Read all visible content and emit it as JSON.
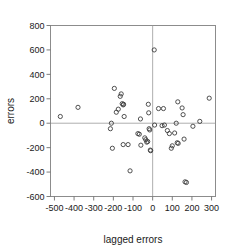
{
  "chart_data": {
    "type": "scatter",
    "title": "",
    "xlabel": "lagged errors",
    "ylabel": "errors",
    "xlim": [
      -520,
      320
    ],
    "ylim": [
      -600,
      800
    ],
    "xticks": [
      -500,
      -400,
      -300,
      -200,
      -100,
      0,
      100,
      200,
      300
    ],
    "xtick_labels": [
      "-500",
      "-400",
      "-300",
      "-200",
      "-100",
      "0",
      "100",
      "200",
      "300"
    ],
    "yticks": [
      -600,
      -400,
      -200,
      0,
      200,
      400,
      600,
      800
    ],
    "ytick_labels": [
      "-600",
      "-400",
      "-200",
      "0",
      "200",
      "400",
      "600",
      "800"
    ],
    "grid": false,
    "legend": null,
    "marker": "open-circle",
    "reference_lines": [
      {
        "axis": "y",
        "value": 0
      },
      {
        "axis": "x",
        "value": 0
      }
    ],
    "points": [
      {
        "x": -470,
        "y": 55
      },
      {
        "x": -380,
        "y": 130
      },
      {
        "x": -215,
        "y": -45
      },
      {
        "x": -210,
        "y": 0
      },
      {
        "x": -205,
        "y": -205
      },
      {
        "x": -195,
        "y": 285
      },
      {
        "x": -185,
        "y": 90
      },
      {
        "x": -175,
        "y": 115
      },
      {
        "x": -165,
        "y": 220
      },
      {
        "x": -160,
        "y": 240
      },
      {
        "x": -155,
        "y": 160
      },
      {
        "x": -150,
        "y": 150
      },
      {
        "x": -148,
        "y": 155
      },
      {
        "x": -145,
        "y": 55
      },
      {
        "x": -150,
        "y": -175
      },
      {
        "x": -125,
        "y": -175
      },
      {
        "x": -115,
        "y": -390
      },
      {
        "x": -75,
        "y": -85
      },
      {
        "x": -68,
        "y": -90
      },
      {
        "x": -62,
        "y": 35
      },
      {
        "x": -60,
        "y": -180
      },
      {
        "x": -40,
        "y": -120
      },
      {
        "x": -35,
        "y": -135
      },
      {
        "x": -30,
        "y": -155
      },
      {
        "x": -25,
        "y": -150
      },
      {
        "x": -22,
        "y": 155
      },
      {
        "x": -20,
        "y": 85
      },
      {
        "x": -18,
        "y": -45
      },
      {
        "x": -15,
        "y": -55
      },
      {
        "x": -12,
        "y": -220
      },
      {
        "x": -10,
        "y": -225
      },
      {
        "x": 8,
        "y": 600
      },
      {
        "x": 10,
        "y": -15
      },
      {
        "x": 30,
        "y": 120
      },
      {
        "x": 55,
        "y": 120
      },
      {
        "x": 48,
        "y": -20
      },
      {
        "x": 60,
        "y": -15
      },
      {
        "x": 75,
        "y": -60
      },
      {
        "x": 85,
        "y": -85
      },
      {
        "x": 95,
        "y": -205
      },
      {
        "x": 100,
        "y": -185
      },
      {
        "x": 112,
        "y": -80
      },
      {
        "x": 120,
        "y": 0
      },
      {
        "x": 125,
        "y": -160
      },
      {
        "x": 130,
        "y": -165
      },
      {
        "x": 128,
        "y": 175
      },
      {
        "x": 150,
        "y": 125
      },
      {
        "x": 155,
        "y": 70
      },
      {
        "x": 160,
        "y": -130
      },
      {
        "x": 165,
        "y": -480
      },
      {
        "x": 172,
        "y": -485
      },
      {
        "x": 205,
        "y": -25
      },
      {
        "x": 240,
        "y": 15
      },
      {
        "x": 288,
        "y": 205
      }
    ]
  }
}
